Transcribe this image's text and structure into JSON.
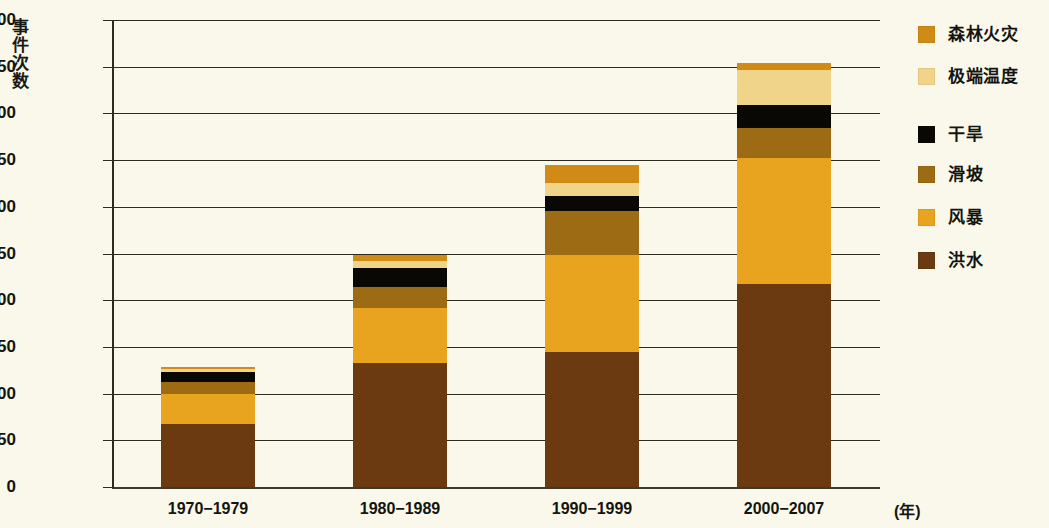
{
  "chart_data": {
    "type": "bar",
    "stacked": true,
    "title": "",
    "subtitle": "",
    "xlabel": "(年)",
    "ylabel": "事件次数",
    "categories": [
      "1970−1979",
      "1980−1989",
      "1990−1999",
      "2000−2007"
    ],
    "ylim": [
      0,
      500
    ],
    "yticks": [
      0,
      50,
      100,
      150,
      200,
      250,
      300,
      350,
      400,
      450,
      500
    ],
    "ytick_labels": [
      "0",
      "50",
      "100",
      "150",
      "200",
      "250",
      "300",
      "350",
      "400",
      "450",
      "500"
    ],
    "grid": true,
    "legend_position": "right",
    "series": [
      {
        "name": "洪水",
        "color": "#6b3a11",
        "values": [
          67,
          133,
          145,
          217
        ]
      },
      {
        "name": "风暴",
        "color": "#e8a41e",
        "values": [
          33,
          59,
          103,
          135
        ]
      },
      {
        "name": "滑坡",
        "color": "#9c6b14",
        "values": [
          12,
          22,
          48,
          32
        ]
      },
      {
        "name": "干旱",
        "color": "#0a0805",
        "values": [
          11,
          21,
          16,
          25
        ]
      },
      {
        "name": "极端温度",
        "color": "#f0d48a",
        "values": [
          3,
          7,
          13,
          37
        ]
      },
      {
        "name": "森林火灾",
        "color": "#d08b16",
        "values": [
          2,
          6,
          20,
          8
        ]
      }
    ],
    "totals": [
      128,
      248,
      345,
      454
    ],
    "legend_order": [
      "森林火灾",
      "极端温度",
      "干旱",
      "滑坡",
      "风暴",
      "洪水"
    ],
    "colors": {
      "background": "#faf8ea",
      "axis": "#2b2b20",
      "text": "#141410",
      "forest_fire": "#d08b16",
      "extreme_temperature": "#f0d48a",
      "drought": "#0a0805",
      "landslide": "#9c6b14",
      "storm": "#e8a41e",
      "flood": "#6b3a11"
    }
  },
  "legend": {
    "items": [
      {
        "label": "森林火灾",
        "color": "#d08b16"
      },
      {
        "label": "极端温度",
        "color": "#f0d48a"
      },
      {
        "label": "干旱",
        "color": "#0a0805"
      },
      {
        "label": "滑坡",
        "color": "#9c6b14"
      },
      {
        "label": "风暴",
        "color": "#e8a41e"
      },
      {
        "label": "洪水",
        "color": "#6b3a11"
      }
    ]
  }
}
